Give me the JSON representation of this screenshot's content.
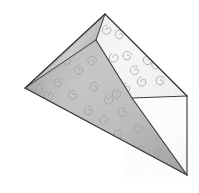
{
  "figure": {
    "type": "line-drawing-illustration",
    "medium": "pencil sketch with graphite shading",
    "background_color": "#ffffff",
    "canvas": {
      "width": 199,
      "height": 193
    }
  },
  "palette": {
    "background": "#ffffff",
    "outline": "#2b2b2b",
    "crease_line": "#4a4a4a",
    "paper_light": "#fcfcfc",
    "paper_mid": "#ededed",
    "paper_shadow": "#b8b8b8",
    "paper_deep_shadow": "#8f8f8f",
    "pattern_ink": "#9a9aa2",
    "underside": "#ffffff"
  },
  "geometry": {
    "vertices": {
      "top_apex": {
        "x": 105,
        "y": 14
      },
      "inner_apex": {
        "x": 96,
        "y": 40
      },
      "left_point": {
        "x": 25,
        "y": 88
      },
      "right_point": {
        "x": 187,
        "y": 96
      },
      "mid_right_hinge": {
        "x": 132,
        "y": 98
      },
      "bottom_point": {
        "x": 187,
        "y": 175
      }
    },
    "facets": [
      {
        "name": "upper-right-facet",
        "points": "105,14 187,96 132,98 96,40",
        "fill": "paper_light",
        "note": "Lighter top-right plane of the patterned sheet"
      },
      {
        "name": "main-left-facet",
        "points": "96,40 132,98 187,175 25,88",
        "fill": "paper_mid",
        "note": "Large shaded front plane with spiral pattern"
      },
      {
        "name": "lower-right-flap",
        "points": "132,98 187,96 187,175",
        "fill": "underside",
        "note": "Reverse side of paper, unpatterned white triangle"
      },
      {
        "name": "top-edge-sliver",
        "points": "105,14 96,40 25,88",
        "fill": "paper_shadow",
        "note": "Thin darker band along the upper-left folded edge"
      }
    ],
    "creases": [
      {
        "name": "apex-vertical-crease",
        "from": "top_apex",
        "to": "inner_apex",
        "style": "valley"
      },
      {
        "name": "central-diagonal-crease",
        "from": "inner_apex",
        "to": "bottom_point",
        "style": "mountain"
      },
      {
        "name": "hinge-horizontal-edge",
        "from": "mid_right_hinge",
        "to": "right_point",
        "style": "edge"
      },
      {
        "name": "right-side-edge",
        "from": "right_point",
        "to": "bottom_point",
        "style": "edge"
      },
      {
        "name": "upper-left-edge",
        "from": "top_apex",
        "to": "left_point",
        "style": "edge"
      },
      {
        "name": "lower-left-edge",
        "from": "left_point",
        "to": "bottom_point",
        "style": "edge"
      }
    ]
  },
  "pattern": {
    "motif_name": "spiral-curl",
    "motif_count": 34,
    "ink_color": "#9a9aa2",
    "description": "Small hand-drawn comma-shaped spiral curls scattered across the patterned faces"
  },
  "a11y": {
    "alt_text": "Pencil drawing of a sheet of spiral-patterned origami paper folded into a triangular form, with a white flap folded out at the lower right."
  }
}
